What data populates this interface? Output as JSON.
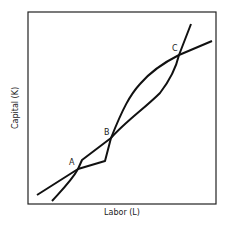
{
  "diagram": {
    "type": "isoquant-intersections",
    "xlabel": "Labor (L)",
    "ylabel": "Capital (K)",
    "points": [
      {
        "label": "A",
        "x": 78,
        "y": 169
      },
      {
        "label": "B",
        "x": 111,
        "y": 138
      },
      {
        "label": "C",
        "x": 179,
        "y": 55
      }
    ],
    "curves": [
      {
        "name": "curve-1",
        "color": "#111111"
      },
      {
        "name": "curve-2",
        "color": "#111111"
      }
    ],
    "frame_color": "#222222"
  }
}
